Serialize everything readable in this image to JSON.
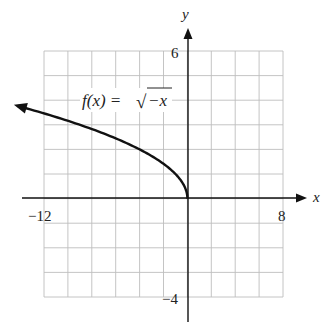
{
  "chart_data": {
    "type": "line",
    "title": "",
    "function_label": "f(x) = √−x",
    "function_label_parts": {
      "lhs": "f(x) =",
      "radical": "√",
      "radicand": "−x"
    },
    "xlabel": "x",
    "ylabel": "y",
    "xlim": [
      -12,
      8
    ],
    "ylim": [
      -4,
      6
    ],
    "x_tick_labels": [
      {
        "value": -12,
        "label": "−12"
      },
      {
        "value": 8,
        "label": "8"
      }
    ],
    "y_tick_labels": [
      {
        "value": 6,
        "label": "6"
      },
      {
        "value": -4,
        "label": "−4"
      }
    ],
    "grid": {
      "on": true,
      "x_step": 2,
      "y_step": 1
    },
    "series": [
      {
        "name": "f(x) = √−x",
        "x": [
          -14.6,
          -12,
          -10,
          -8,
          -6,
          -4,
          -2,
          -1,
          -0.5,
          0
        ],
        "values": [
          3.82,
          3.46,
          3.16,
          2.83,
          2.45,
          2.0,
          1.41,
          1.0,
          0.71,
          0
        ],
        "arrow_left": true,
        "endpoint_right": [
          0,
          0
        ]
      }
    ],
    "colors": {
      "curve": "#111111",
      "grid": "#bdbdbd",
      "axis": "#111111"
    }
  }
}
